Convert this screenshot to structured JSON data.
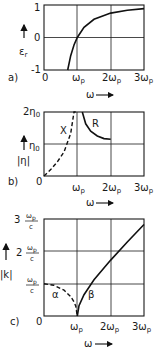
{
  "chart_data": [
    {
      "panel": "a)",
      "type": "line",
      "xlabel": "ω",
      "ylabel": "ε_r",
      "x_ticks": [
        "0",
        "ω_p",
        "2ω_p",
        "3ω_p"
      ],
      "y_ticks": [
        "-1",
        "0",
        "1"
      ],
      "xlim": [
        0,
        3
      ],
      "ylim": [
        -1,
        1
      ],
      "grid": true,
      "series": [
        {
          "name": "ε_r = 1 - ω_p²/ω²",
          "style": "solid",
          "x": [
            0.71,
            0.8,
            0.9,
            1.0,
            1.2,
            1.5,
            2.0,
            2.5,
            3.0
          ],
          "y": [
            -1.0,
            -0.56,
            -0.23,
            0.0,
            0.31,
            0.56,
            0.75,
            0.84,
            0.89
          ]
        }
      ]
    },
    {
      "panel": "b)",
      "type": "line",
      "xlabel": "ω",
      "ylabel": "|η|",
      "x_ticks": [
        "0",
        "ω_p",
        "2ω_p",
        "3ω_p"
      ],
      "y_ticks": [
        "η_0",
        "2η_0"
      ],
      "xlim": [
        0,
        3
      ],
      "ylim": [
        0,
        2
      ],
      "grid": true,
      "series": [
        {
          "name": "X",
          "style": "dashed",
          "x": [
            0.0,
            0.2,
            0.4,
            0.6,
            0.8,
            0.9,
            0.95
          ],
          "y": [
            0.0,
            0.2,
            0.44,
            0.75,
            1.33,
            2.0,
            2.0
          ]
        },
        {
          "name": "R",
          "style": "solid",
          "x": [
            1.15,
            1.25,
            1.4,
            1.6,
            1.8,
            2.0
          ],
          "y": [
            2.0,
            1.63,
            1.4,
            1.25,
            1.17,
            1.15
          ]
        }
      ]
    },
    {
      "panel": "c)",
      "type": "line",
      "xlabel": "ω",
      "ylabel": "|k|",
      "x_ticks": [
        "0",
        "ω_p",
        "2ω_p",
        "3ω_p"
      ],
      "y_ticks": [
        "ω_p/c",
        "2 ω_p/c",
        "3 ω_p/c"
      ],
      "xlim": [
        0,
        3
      ],
      "ylim": [
        0,
        3
      ],
      "grid": true,
      "series": [
        {
          "name": "α",
          "style": "dashed",
          "x": [
            0.0,
            0.3,
            0.6,
            0.8,
            0.9,
            0.95,
            1.0
          ],
          "y": [
            1.0,
            0.95,
            0.8,
            0.6,
            0.44,
            0.31,
            0.0
          ]
        },
        {
          "name": "β",
          "style": "solid",
          "x": [
            1.0,
            1.05,
            1.2,
            1.5,
            2.0,
            2.5,
            3.0
          ],
          "y": [
            0.0,
            0.32,
            0.66,
            1.12,
            1.73,
            2.29,
            2.83
          ]
        }
      ]
    }
  ],
  "labels": {
    "a": {
      "panel": "a)",
      "ylabel": "ε",
      "ysub": "r",
      "y_top": "1",
      "y_mid": "0",
      "y_bot": "-1",
      "x0": "0",
      "x1": "ω",
      "x2": "2ω",
      "x3": "3ω",
      "xsub": "p",
      "xlabel": "ω"
    },
    "b": {
      "panel": "b)",
      "ylabel": "|η|",
      "y_top": "2η",
      "y_mid": "η",
      "ysub": "0",
      "x0": "0",
      "x1": "ω",
      "x2": "2ω",
      "x3": "3ω",
      "xsub": "p",
      "xlabel": "ω",
      "curve_x": "X",
      "curve_r": "R"
    },
    "c": {
      "panel": "c)",
      "ylabel": "|k|",
      "y3_pre": "3",
      "y2_pre": "2",
      "y_num": "ω",
      "y_numsub": "p",
      "y_den": "c",
      "x0": "0",
      "x1": "ω",
      "x2": "2ω",
      "x3": "3ω",
      "xsub": "p",
      "xlabel": "ω",
      "curve_alpha": "α",
      "curve_beta": "β"
    }
  }
}
